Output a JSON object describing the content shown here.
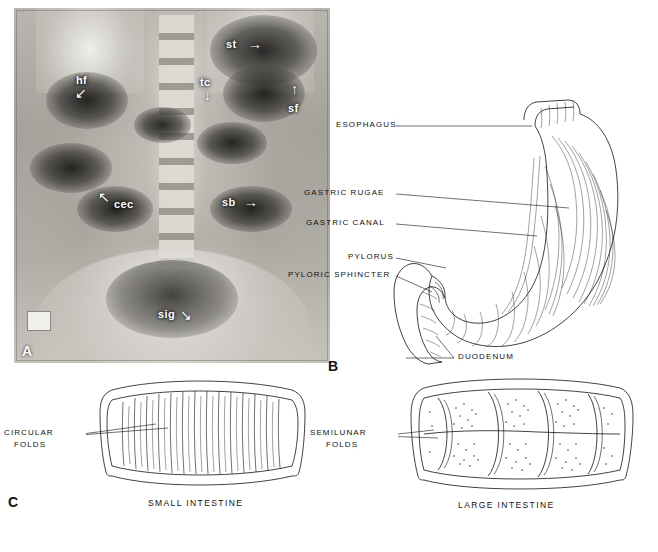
{
  "figure": {
    "panels": [
      {
        "letter": "A",
        "name": "radiograph-abdomen",
        "annotations": [
          {
            "id": "st",
            "label": "st",
            "x": 226,
            "y": 44,
            "arrow": "→",
            "arrow_x": 252,
            "arrow_y": 42
          },
          {
            "id": "hf",
            "label": "hf",
            "x": 74,
            "y": 80,
            "arrow": "↙",
            "arrow_x": 72,
            "arrow_y": 92
          },
          {
            "id": "tc",
            "label": "tc",
            "x": 196,
            "y": 82,
            "arrow": "↓",
            "arrow_x": 200,
            "arrow_y": 94
          },
          {
            "id": "sf",
            "label": "sf",
            "x": 286,
            "y": 108,
            "arrow": "↑",
            "arrow_x": 289,
            "arrow_y": 88
          },
          {
            "id": "cec",
            "label": "cec",
            "x": 114,
            "y": 203,
            "arrow": "↖",
            "arrow_x": 95,
            "arrow_y": 198
          },
          {
            "id": "sb",
            "label": "sb",
            "x": 222,
            "y": 201,
            "arrow": "→",
            "arrow_x": 247,
            "arrow_y": 200
          },
          {
            "id": "sig",
            "label": "sig",
            "x": 158,
            "y": 315,
            "arrow": "↘",
            "arrow_x": 182,
            "arrow_y": 316
          }
        ]
      },
      {
        "letter": "B",
        "name": "stomach-diagram",
        "labels": [
          {
            "id": "esophagus",
            "text": "ESOPHAGUS"
          },
          {
            "id": "gastric-rugae",
            "text": "GASTRIC  RUGAE"
          },
          {
            "id": "gastric-canal",
            "text": "GASTRIC  CANAL"
          },
          {
            "id": "pylorus",
            "text": "PYLORUS"
          },
          {
            "id": "pyloric-sphincter",
            "text": "PYLORIC  SPHINCTER"
          },
          {
            "id": "duodenum",
            "text": "DUODENUM"
          }
        ]
      },
      {
        "letter": "C",
        "name": "intestine-diagrams",
        "labels": [
          {
            "id": "circular-folds",
            "text": "CIRCULAR"
          },
          {
            "id": "circular-folds2",
            "text": "FOLDS"
          },
          {
            "id": "semilunar-folds",
            "text": "SEMILUNAR"
          },
          {
            "id": "semilunar-folds2",
            "text": "FOLDS"
          }
        ],
        "captions": [
          {
            "id": "small-intestine",
            "text": "SMALL  INTESTINE"
          },
          {
            "id": "large-intestine",
            "text": "LARGE  INTESTINE"
          }
        ]
      }
    ]
  },
  "colors": {
    "ink": "#111111",
    "film_light": "#e8e6e2",
    "film_dark": "#1a1917",
    "page": "#ffffff"
  }
}
